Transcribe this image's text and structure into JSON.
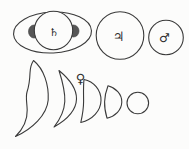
{
  "figure": {
    "colors": {
      "ink": "#3a3a3a",
      "paper": "#fcfcfb",
      "shadow_shade": "#565656"
    },
    "saturn": {
      "symbol": "♄"
    },
    "jupiter": {
      "symbol": "♃"
    },
    "mars": {
      "symbol": "♂"
    },
    "venus": {
      "symbol": "♀"
    }
  }
}
